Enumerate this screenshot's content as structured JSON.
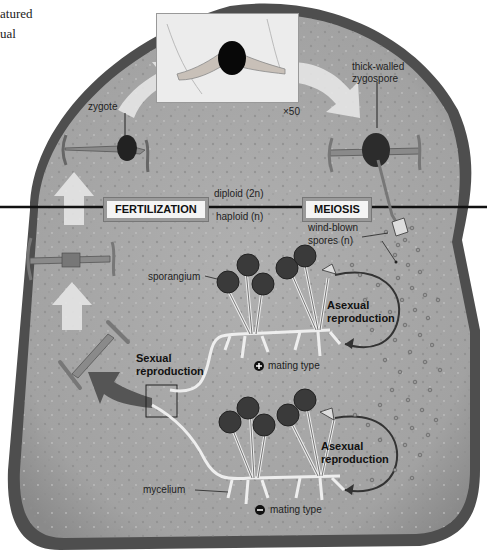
{
  "caption": {
    "line1": "atured",
    "line2": "ual"
  },
  "micrograph": {
    "magnification": "×50"
  },
  "labels": {
    "zygote": "zygote",
    "zygospore_line1": "thick-walled",
    "zygospore_line2": "zygospore",
    "fertilization": "FERTILIZATION",
    "meiosis": "MEIOSIS",
    "diploid": "diploid (2n)",
    "haploid": "haploid (n)",
    "spores_line1": "wind-blown",
    "spores_line2": "spores (n)",
    "sporangium": "sporangium",
    "asexual_top_line1": "Asexual",
    "asexual_top_line2": "reproduction",
    "sexual_line1": "Sexual",
    "sexual_line2": "reproduction",
    "plus_mating": "mating type",
    "asexual_bottom_line1": "Asexual",
    "asexual_bottom_line2": "reproduction",
    "mycelium": "mycelium",
    "minus_mating": "mating type"
  },
  "symbols": {
    "plus": "+",
    "minus": "−"
  },
  "colors": {
    "bread": "#a8a8a8",
    "crust": "#4a4a4a",
    "line": "#111111",
    "arrow": "#e6e6e6",
    "dark_arrow": "#555555"
  }
}
